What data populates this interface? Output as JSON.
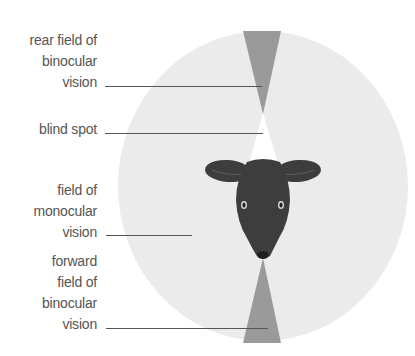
{
  "diagram": {
    "colors": {
      "monocular_field": "#ebebeb",
      "binocular_field": "#9a9a9a",
      "blind_spot": "#ffffff",
      "head": "#3d3d3d",
      "leader_line": "#555555",
      "label_text": "#555555"
    },
    "labels": [
      {
        "id": "rear-binocular",
        "lines": [
          "rear field of",
          "binocular",
          "vision"
        ]
      },
      {
        "id": "blind-spot",
        "lines": [
          "blind spot"
        ]
      },
      {
        "id": "monocular",
        "lines": [
          "field of",
          "monocular",
          "vision"
        ]
      },
      {
        "id": "forward-binocular",
        "lines": [
          "forward",
          "field of",
          "binocular",
          "vision"
        ]
      }
    ],
    "regions": [
      {
        "name": "field of monocular vision",
        "shape": "ellipse"
      },
      {
        "name": "rear field of binocular vision",
        "shape": "wedge",
        "position": "top"
      },
      {
        "name": "blind spot",
        "shape": "wedge",
        "position": "behind head"
      },
      {
        "name": "forward field of binocular vision",
        "shape": "wedge",
        "position": "bottom"
      }
    ]
  }
}
